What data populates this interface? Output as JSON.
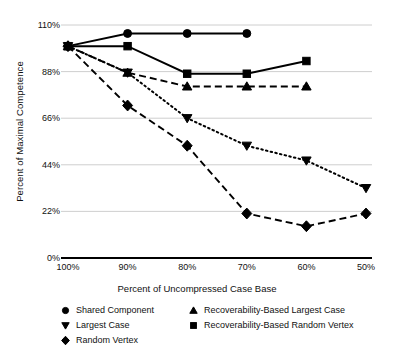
{
  "chart_data": {
    "type": "line",
    "title": "",
    "xlabel": "Percent of Uncompressed Case Base",
    "ylabel": "Percent of Maximal Competence",
    "categories": [
      "100%",
      "90%",
      "80%",
      "70%",
      "60%",
      "50%"
    ],
    "x": [
      100,
      90,
      80,
      70,
      60,
      50
    ],
    "xlim": [
      100,
      50
    ],
    "ylim": [
      0,
      110
    ],
    "yticks": [
      "0%",
      "22%",
      "44%",
      "66%",
      "88%",
      "110%"
    ],
    "ytick_values": [
      0,
      22,
      44,
      66,
      88,
      110
    ],
    "grid": "horizontal",
    "legend_position": "bottom",
    "series": [
      {
        "name": "Shared Component",
        "marker": "circle",
        "linestyle": "solid",
        "color": "#000000",
        "values": [
          100,
          106,
          106,
          106,
          null,
          null
        ]
      },
      {
        "name": "Largest Case",
        "marker": "triangle-down",
        "linestyle": "dotted",
        "color": "#000000",
        "values": [
          100,
          87.5,
          66,
          53,
          46,
          33
        ]
      },
      {
        "name": "Random Vertex",
        "marker": "diamond",
        "linestyle": "dashed",
        "color": "#000000",
        "values": [
          100,
          72,
          53,
          21,
          15,
          21
        ]
      },
      {
        "name": "Recoverability-Based Largest Case",
        "marker": "triangle-up",
        "linestyle": "dashed",
        "color": "#000000",
        "values": [
          100,
          87.5,
          81,
          81,
          81,
          null
        ]
      },
      {
        "name": "Recoverability-Based Random Vertex",
        "marker": "square",
        "linestyle": "solid",
        "color": "#000000",
        "values": [
          100,
          100,
          87,
          87,
          93,
          null
        ]
      }
    ]
  },
  "legend": {
    "items": [
      {
        "label": "Shared Component",
        "marker": "circle"
      },
      {
        "label": "Recoverability-Based Largest Case",
        "marker": "triangle-up"
      },
      {
        "label": "Largest Case",
        "marker": "triangle-down"
      },
      {
        "label": "Recoverability-Based Random Vertex",
        "marker": "square"
      },
      {
        "label": "Random Vertex",
        "marker": "diamond"
      }
    ]
  },
  "style": {
    "grid_color": "#c8c8c8",
    "axis_color": "#000000",
    "ink": "#000000",
    "background": "#ffffff"
  }
}
